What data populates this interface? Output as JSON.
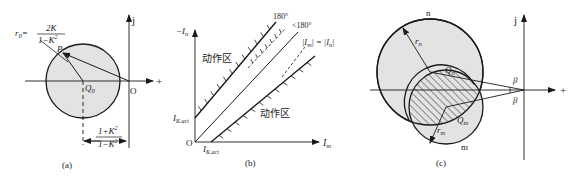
{
  "figure": {
    "panels": [
      {
        "id": "a",
        "caption": "(a)",
        "axis_labels": {
          "imag": "j",
          "real": "+",
          "origin": "O"
        },
        "radius_label": {
          "lhs": "r",
          "lhs_sub": "0",
          "eq": "=",
          "num": "2K",
          "den": "1−K",
          "den_sup": "2"
        },
        "point_label": "P",
        "center_label": "Q",
        "center_sub": "0",
        "distance_label": {
          "num": "1+K",
          "num_sup": "2",
          "den": "1−K",
          "den_sup": "2"
        }
      },
      {
        "id": "b",
        "caption": "(b)",
        "y_axis_label": "−I",
        "y_axis_sub": "n",
        "x_axis_label": "I",
        "x_axis_sub": "m",
        "origin": "O",
        "y_intercept_label": "I",
        "y_intercept_sub": "K.act",
        "x_intercept_label": "I",
        "x_intercept_sub": "K.act",
        "angle_label_upper": "180°",
        "angle_label_lower": "<180°",
        "equal_mag_label": {
          "pre": "|",
          "a": "I",
          "a_sub": "m",
          "mid": "| = |",
          "b": "I",
          "b_sub": "n",
          "post": "|"
        },
        "zone_upper": "动作区",
        "zone_lower": "动作区"
      },
      {
        "id": "c",
        "caption": "(c)",
        "axis_labels": {
          "imag": "j",
          "real": "+"
        },
        "circle_n_label": "n",
        "circle_m_label": "m",
        "radius_n": "r",
        "radius_n_sub": "n",
        "radius_m": "r",
        "radius_m_sub": "m",
        "center_n": "Q",
        "center_n_sub": "n",
        "center_m": "Q",
        "center_m_sub": "m",
        "angle_upper": "β",
        "angle_lower": "β"
      }
    ],
    "colors": {
      "fill": "#e3e3e3",
      "stroke": "#1a1a1a",
      "hatch": "#333333"
    }
  }
}
